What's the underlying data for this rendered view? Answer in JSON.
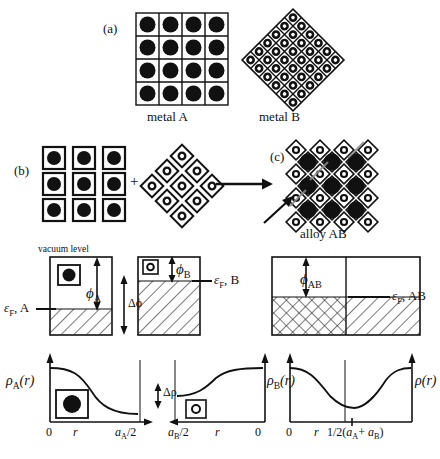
{
  "figure": {
    "title_panels": [
      "(a)",
      "(b)",
      "(c)"
    ],
    "panel_a": {
      "tag": "(a)",
      "left_caption": "metal A",
      "right_caption": "metal B",
      "lattice_a": {
        "rows": 4,
        "cols": 4,
        "atom": "large-filled-circle",
        "cell": "square"
      },
      "lattice_b": {
        "rows": 6,
        "cols": 6,
        "atom": "small-ring-circle",
        "cell": "diamond",
        "rotation_deg": 45
      }
    },
    "panel_b": {
      "tag": "(b)",
      "plus_sign": "+",
      "cluster_a": {
        "rows": 3,
        "cols": 3,
        "atom": "large-filled-circle",
        "cell": "square-outline"
      },
      "cluster_b": {
        "count": 9,
        "atom": "small-ring-circle",
        "cell": "diamond-outline"
      }
    },
    "panel_c": {
      "tag": "(c)",
      "caption": "alloy AB",
      "arrow_annotation": "interface-arrow"
    },
    "energy_diagram": {
      "vacuum_label": "vacuum level",
      "phi_a": "ϕ",
      "phi_a_sub": "A",
      "phi_b": "ϕ",
      "phi_b_sub": "B",
      "delta_phi": "Δϕ",
      "phi_ab": "ϕ",
      "phi_ab_sub": "AB",
      "eF_a": "ε",
      "eF_a_sub": "F",
      "eF_a_tail": ", A",
      "eF_b": "ε",
      "eF_b_sub": "F",
      "eF_b_tail": ", B",
      "eF_ab": "ε",
      "eF_ab_sub": "F",
      "eF_ab_tail": ", AB"
    },
    "density_plots": {
      "rho_a": "ρ",
      "rho_a_sub": "A",
      "rho_a_arg": "(r)",
      "rho_b": "ρ",
      "rho_b_sub": "B",
      "rho_b_arg": "(r)",
      "rho_ab": "ρ",
      "rho_ab_arg": "(r)",
      "delta_rho": "Δρ",
      "axis_zero_left": "0",
      "axis_r_left": "r",
      "axis_aa_half": "a",
      "axis_aa_half_sub": "A",
      "axis_aa_half_tail": "/2",
      "axis_ab_half": "a",
      "axis_ab_half_sub": "B",
      "axis_ab_half_tail": "/2",
      "axis_r_mid": "r",
      "axis_zero_right": "0",
      "axis_zero_alloy": "0",
      "axis_r_alloy": "r",
      "axis_mid_alloy_pre": "1/2(",
      "axis_mid_alloy_a": "a",
      "axis_mid_alloy_a_sub": "A",
      "axis_mid_alloy_plus": "+ ",
      "axis_mid_alloy_b": "a",
      "axis_mid_alloy_b_sub": "B",
      "axis_mid_alloy_post": ")"
    },
    "colors": {
      "ink": "#111111",
      "paper": "#ffffff",
      "hatch": "#333333"
    }
  }
}
